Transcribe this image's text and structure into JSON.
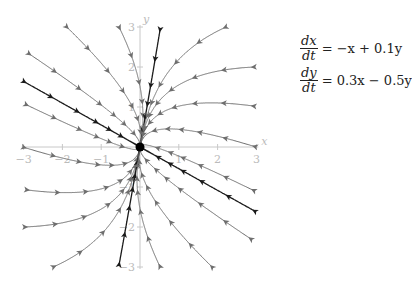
{
  "system": {
    "a": -1.0,
    "b": 0.1,
    "c": 0.3,
    "d": -0.5,
    "eq1": {
      "num": "dx",
      "den": "dt",
      "rhs": "= −x + 0.1y"
    },
    "eq2": {
      "num": "dy",
      "den": "dt",
      "rhs": "= 0.3x − 0.5y"
    }
  },
  "axes": {
    "x_label": "x",
    "y_label": "y",
    "x_ticks": [
      "−3",
      "−2",
      "−1",
      "1",
      "2",
      "3"
    ],
    "y_ticks": [
      "3",
      "2",
      "1",
      "−1",
      "−2",
      "−3"
    ],
    "xlim": [
      -3,
      3
    ],
    "ylim": [
      -3,
      3
    ],
    "color": "#c8c8c8"
  },
  "equilibrium": {
    "x": 0,
    "y": 0,
    "type": "stable node"
  },
  "colors": {
    "gray_curve": "#6e6e6e",
    "dark_curve": "#1a1a1a",
    "point": "#000000"
  },
  "trajectories": [
    {
      "x0": -1.91,
      "y0": 3.02,
      "style": "gray"
    },
    {
      "x0": -2.89,
      "y0": 2.35,
      "style": "gray"
    },
    {
      "x0": -3.02,
      "y0": 1.65,
      "style": "dark"
    },
    {
      "x0": -2.96,
      "y0": 1.07,
      "style": "gray"
    },
    {
      "x0": -3.02,
      "y0": 0.0,
      "style": "gray"
    },
    {
      "x0": -2.94,
      "y0": -1.07,
      "style": "gray"
    },
    {
      "x0": -2.99,
      "y0": -2.0,
      "style": "gray"
    },
    {
      "x0": -2.24,
      "y0": -3.0,
      "style": "gray"
    },
    {
      "x0": -0.54,
      "y0": 3.0,
      "style": "gray"
    },
    {
      "x0": 0.52,
      "y0": 2.95,
      "style": "dark"
    },
    {
      "x0": -0.54,
      "y0": -2.95,
      "style": "dark"
    },
    {
      "x0": 0.52,
      "y0": -3.0,
      "style": "gray"
    },
    {
      "x0": 2.22,
      "y0": 3.0,
      "style": "gray"
    },
    {
      "x0": 2.96,
      "y0": 2.0,
      "style": "gray"
    },
    {
      "x0": 2.96,
      "y0": 1.02,
      "style": "gray"
    },
    {
      "x0": 2.99,
      "y0": 0.0,
      "style": "gray"
    },
    {
      "x0": 2.96,
      "y0": -1.1,
      "style": "gray"
    },
    {
      "x0": 2.99,
      "y0": -1.62,
      "style": "dark"
    },
    {
      "x0": 2.89,
      "y0": -2.32,
      "style": "gray"
    },
    {
      "x0": 1.88,
      "y0": -3.02,
      "style": "gray"
    }
  ]
}
